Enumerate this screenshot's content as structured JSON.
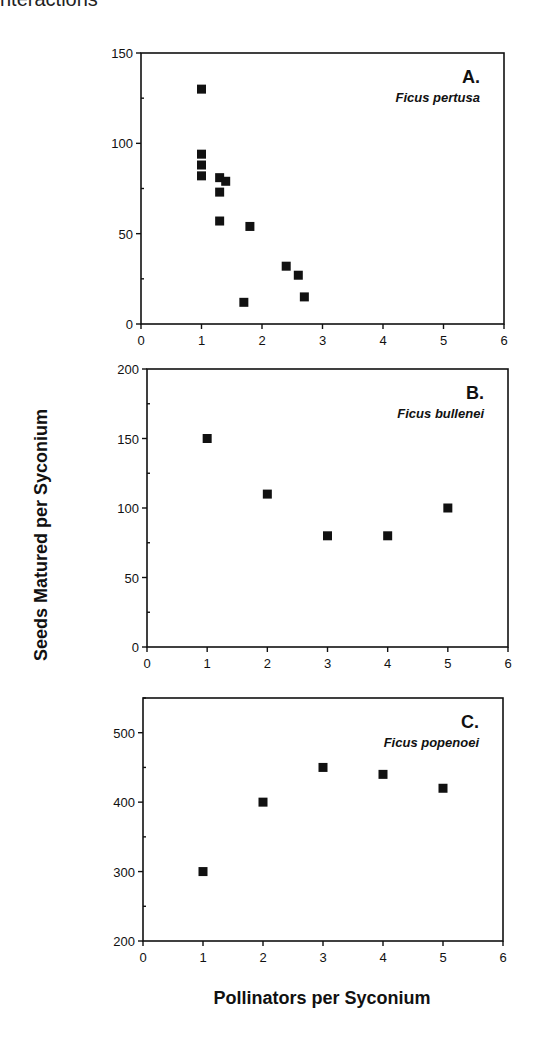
{
  "page": {
    "top_fragment": "nteractions"
  },
  "chart_data": {
    "type": "scatter",
    "xlabel": "Pollinators per Syconium",
    "ylabel": "Seeds Matured per Syconium",
    "panels": [
      {
        "id": "A",
        "letter": "A.",
        "species": "Ficus pertusa",
        "xlim": [
          0,
          6
        ],
        "ylim": [
          0,
          150
        ],
        "xticks": [
          0,
          1,
          2,
          3,
          4,
          5,
          6
        ],
        "yticks": [
          0,
          50,
          100,
          150
        ],
        "points": [
          {
            "x": 1.0,
            "y": 130
          },
          {
            "x": 1.0,
            "y": 94
          },
          {
            "x": 1.0,
            "y": 88
          },
          {
            "x": 1.0,
            "y": 82
          },
          {
            "x": 1.3,
            "y": 81
          },
          {
            "x": 1.4,
            "y": 79
          },
          {
            "x": 1.3,
            "y": 73
          },
          {
            "x": 1.3,
            "y": 57
          },
          {
            "x": 1.8,
            "y": 54
          },
          {
            "x": 1.7,
            "y": 12
          },
          {
            "x": 2.4,
            "y": 32
          },
          {
            "x": 2.6,
            "y": 27
          },
          {
            "x": 2.7,
            "y": 15
          }
        ]
      },
      {
        "id": "B",
        "letter": "B.",
        "species": "Ficus bullenei",
        "xlim": [
          0,
          6
        ],
        "ylim": [
          0,
          200
        ],
        "xticks": [
          0,
          1,
          2,
          3,
          4,
          5,
          6
        ],
        "yticks": [
          0,
          50,
          100,
          150,
          200
        ],
        "points": [
          {
            "x": 1,
            "y": 150
          },
          {
            "x": 2,
            "y": 110
          },
          {
            "x": 3,
            "y": 80
          },
          {
            "x": 4,
            "y": 80
          },
          {
            "x": 5,
            "y": 100
          }
        ]
      },
      {
        "id": "C",
        "letter": "C.",
        "species": "Ficus popenoei",
        "xlim": [
          0,
          6
        ],
        "ylim": [
          200,
          550
        ],
        "xticks": [
          0,
          1,
          2,
          3,
          4,
          5,
          6
        ],
        "yticks": [
          200,
          300,
          400,
          500
        ],
        "points": [
          {
            "x": 1,
            "y": 300
          },
          {
            "x": 2,
            "y": 400
          },
          {
            "x": 3,
            "y": 450
          },
          {
            "x": 4,
            "y": 440
          },
          {
            "x": 5,
            "y": 420
          }
        ]
      }
    ],
    "marker": "filled-square",
    "marker_color": "#111111",
    "grid": false,
    "legend": null
  }
}
